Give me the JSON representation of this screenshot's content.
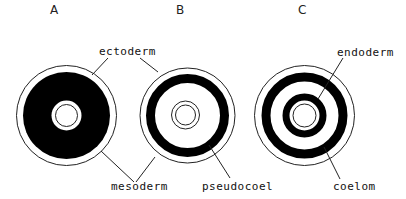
{
  "panels": [
    {
      "id": "A",
      "label": "A"
    },
    {
      "id": "B",
      "label": "B"
    },
    {
      "id": "C",
      "label": "C"
    }
  ],
  "labels": {
    "ectoderm": "ectoderm",
    "mesoderm": "mesoderm",
    "pseudocoel": "pseudocoel",
    "endoderm": "endoderm",
    "coelom": "coelom"
  },
  "colors": {
    "fill": "#000000",
    "line": "#222222",
    "background": "#ffffff"
  }
}
